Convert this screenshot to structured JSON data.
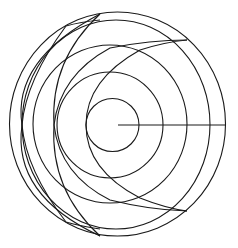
{
  "diagram": {
    "type": "geometric-line-drawing",
    "stroke_color": "#1a1a1a",
    "background_color": "#ffffff",
    "outer_circle": {
      "cx": 117.5,
      "cy": 124,
      "rx": 108,
      "ry": 112
    },
    "inner_circles": [
      {
        "cx": 112.5,
        "cy": 125,
        "r": 26.5
      },
      {
        "cx": 110,
        "cy": 125,
        "r": 53
      },
      {
        "cx": 108.5,
        "cy": 124.5,
        "r": 79
      },
      {
        "cx": 115,
        "cy": 124.5,
        "r": 104
      }
    ],
    "radius_line": {
      "x1": 118,
      "y1": 125,
      "x2": 225,
      "y2": 125
    },
    "cusps": [
      [
        22,
        125
      ],
      [
        54,
        125
      ],
      [
        86,
        125
      ]
    ]
  }
}
